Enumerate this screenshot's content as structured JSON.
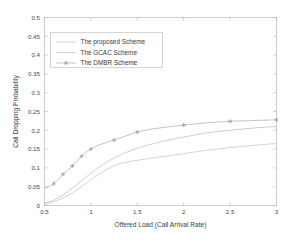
{
  "chart_data": {
    "type": "line",
    "title": "",
    "xlabel": "Offered Load (Call Arrival Rate)",
    "ylabel": "Call Dropping Probability",
    "xlim": [
      0.5,
      3
    ],
    "ylim": [
      0,
      0.5
    ],
    "grid": false,
    "legend_position": "upper-left",
    "xticks": [
      0.5,
      1,
      1.5,
      2,
      2.5,
      3
    ],
    "xtick_labels": [
      "0.5",
      "1",
      "1.5",
      "2",
      "2.5",
      "3"
    ],
    "yticks": [
      0,
      0.05,
      0.1,
      0.15,
      0.2,
      0.25,
      0.3,
      0.35,
      0.4,
      0.45,
      0.5
    ],
    "ytick_labels": [
      "0",
      "0.05",
      "0.1",
      "0.15",
      "0.2",
      "0.25",
      "0.3",
      "0.35",
      "0.4",
      "0.45",
      "0.5"
    ],
    "x": [
      0.5,
      0.6,
      0.7,
      0.8,
      0.9,
      1.0,
      1.1,
      1.25,
      1.4,
      1.5,
      1.65,
      1.8,
      2.0,
      2.25,
      2.5,
      2.75,
      3.0
    ],
    "series": [
      {
        "name": "The proposed Scheme",
        "marker": "none",
        "color": "#c8c8c8",
        "values": [
          0.004,
          0.01,
          0.02,
          0.034,
          0.05,
          0.068,
          0.085,
          0.106,
          0.116,
          0.12,
          0.126,
          0.131,
          0.138,
          0.147,
          0.154,
          0.16,
          0.165
        ]
      },
      {
        "name": "The GCAC Scheme",
        "marker": "none",
        "color": "#c0c0c0",
        "values": [
          0.005,
          0.014,
          0.028,
          0.046,
          0.066,
          0.086,
          0.104,
          0.126,
          0.143,
          0.152,
          0.163,
          0.172,
          0.182,
          0.193,
          0.2,
          0.206,
          0.21
        ]
      },
      {
        "name": "The DMBR Scheme",
        "marker": "asterisk",
        "color": "#b4b4b4",
        "marker_x": [
          0.6,
          0.7,
          0.8,
          0.9,
          1.0,
          1.25,
          1.5,
          2.0,
          2.5,
          3.0
        ],
        "marker_y": [
          0.058,
          0.083,
          0.105,
          0.131,
          0.15,
          0.174,
          0.195,
          0.214,
          0.224,
          0.228
        ],
        "values": [
          0.045,
          0.058,
          0.083,
          0.105,
          0.131,
          0.15,
          0.162,
          0.174,
          0.187,
          0.195,
          0.203,
          0.208,
          0.214,
          0.22,
          0.224,
          0.226,
          0.228
        ]
      }
    ]
  },
  "legend": {
    "entries": [
      {
        "label": "The proposed Scheme"
      },
      {
        "label": "The GCAC Scheme"
      },
      {
        "label": "The DMBR Scheme"
      }
    ]
  }
}
